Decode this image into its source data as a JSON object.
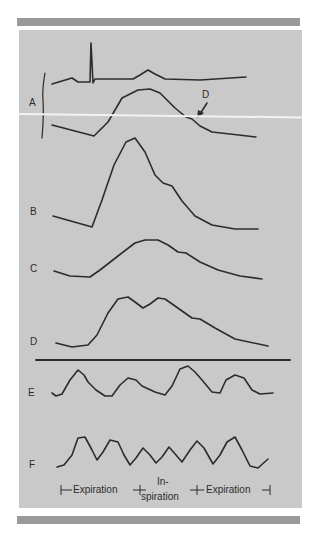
{
  "figure": {
    "trace_labels": {
      "A": "A",
      "B": "B",
      "C": "C",
      "D": "D",
      "E": "E",
      "F": "F"
    },
    "annotation": {
      "arrow_label": "D"
    },
    "axis": {
      "expiration_left": "Expiration",
      "inspiration_top": "In-",
      "inspiration_bottom": "spiration",
      "expiration_right": "Expiration"
    },
    "colors": {
      "panel": "#c9c9c9",
      "bars": "#9a9a9a",
      "trace": "#2c2c2c"
    }
  }
}
